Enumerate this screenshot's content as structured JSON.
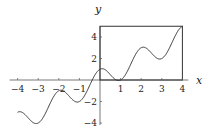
{
  "chart_data": {
    "type": "line",
    "title": "",
    "xlabel": "x",
    "ylabel": "y",
    "xlim": [
      -4,
      4
    ],
    "ylim": [
      -4,
      5
    ],
    "grid": false,
    "x_ticks": [
      -4,
      -3,
      -2,
      -1,
      1,
      2,
      3,
      4
    ],
    "x_tick_labels": [
      "−4",
      "−3",
      "−2",
      "−1",
      "1",
      "2",
      "3",
      "4"
    ],
    "y_ticks": [
      -4,
      -2,
      2,
      4
    ],
    "y_tick_labels": [
      "−4",
      "−2",
      "2",
      "4"
    ],
    "series": [
      {
        "name": "y = x + cos(πx)",
        "x": [
          -4,
          -3.5,
          -3,
          -2.5,
          -2,
          -1.5,
          -1,
          -0.5,
          0,
          0.5,
          1,
          1.5,
          2,
          2.5,
          3,
          3.5,
          4
        ],
        "values": [
          -3,
          -3.5,
          -4,
          -2.5,
          -1,
          -1.5,
          -2,
          -0.5,
          1,
          0.5,
          0,
          1.5,
          3,
          2.5,
          2,
          3.5,
          5
        ],
        "color": "#333333"
      }
    ],
    "annotations": [
      {
        "type": "rectangle",
        "x0": 0,
        "y0": 0,
        "x1": 4,
        "y1": 5,
        "note": "box from origin to endpoint (4,5)"
      }
    ]
  },
  "labels": {
    "x_axis": "x",
    "y_axis": "y"
  }
}
